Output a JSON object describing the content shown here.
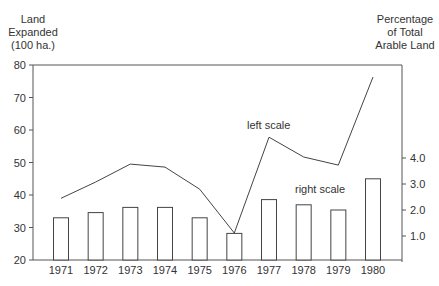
{
  "chart_data": {
    "type": "bar+line",
    "title": "",
    "xlabel": "",
    "categories": [
      "1971",
      "1972",
      "1973",
      "1974",
      "1975",
      "1976",
      "1977",
      "1978",
      "1979",
      "1980"
    ],
    "left_axis": {
      "label": [
        "Land",
        "Expanded",
        "(100 ha.)"
      ],
      "ticks": [
        20,
        30,
        40,
        50,
        60,
        70,
        80
      ],
      "ylim": [
        20,
        80
      ]
    },
    "right_axis": {
      "label": [
        "Percentage",
        "of Total",
        "Arable Land"
      ],
      "ticks": [
        "1.0",
        "2.0",
        "3.0",
        "4.0"
      ],
      "ylim": [
        0,
        7.5
      ]
    },
    "series": [
      {
        "name": "Land Expanded (100 ha.)",
        "type": "line",
        "axis": "left",
        "annotation": "left scale",
        "values": [
          39,
          44,
          49.5,
          48.6,
          41.8,
          28.3,
          57.8,
          51.7,
          49.2,
          76.3
        ]
      },
      {
        "name": "Percentage of Total Arable Land",
        "type": "bar",
        "axis": "right",
        "annotation": "right scale",
        "values": [
          1.7,
          1.9,
          2.1,
          2.1,
          1.7,
          1.1,
          2.4,
          2.2,
          2.0,
          3.2
        ]
      }
    ],
    "grid": false,
    "legend": "none (inline annotations)"
  },
  "labels": {
    "left_title_1": "Land",
    "left_title_2": "Expanded",
    "left_title_3": "(100 ha.)",
    "right_title_1": "Percentage",
    "right_title_2": "of Total",
    "right_title_3": "Arable Land",
    "line_annotation": "left scale",
    "bar_annotation": "right scale"
  },
  "colors": {
    "line": "#444444",
    "bar_stroke": "#444444",
    "bar_fill": "#ffffff",
    "axis": "#555555",
    "text": "#333333"
  }
}
